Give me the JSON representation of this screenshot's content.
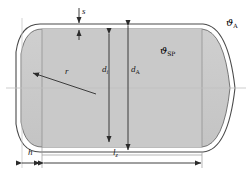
{
  "figure": {
    "type": "engineering-cross-section",
    "fill_color": "#c9c9c9",
    "outline_color": "#3a3a3a",
    "dimension_color": "#2b2b2b",
    "centerline_color": "#b8b8b8",
    "background": "#ffffff"
  },
  "labels": {
    "wall_thickness": {
      "symbol": "s",
      "subscript": ""
    },
    "radius": {
      "symbol": "r",
      "subscript": ""
    },
    "inner_diameter": {
      "symbol": "d",
      "subscript": "i"
    },
    "outer_diameter": {
      "symbol": "d",
      "subscript": "A"
    },
    "cap_height": {
      "symbol": "h",
      "subscript": ""
    },
    "cyl_length": {
      "symbol": "l",
      "subscript": "z"
    },
    "temp_ambient": {
      "symbol": "ϑ",
      "subscript": "A"
    },
    "temp_storage": {
      "symbol": "ϑ",
      "subscript": "SP"
    }
  },
  "dimensions": [
    {
      "name": "s",
      "orientation": "vertical",
      "kind": "wall-thickness"
    },
    {
      "name": "r",
      "orientation": "diagonal",
      "kind": "radius-leader"
    },
    {
      "name": "d_i",
      "orientation": "vertical",
      "kind": "double-arrow"
    },
    {
      "name": "d_A",
      "orientation": "vertical",
      "kind": "double-arrow"
    },
    {
      "name": "h",
      "orientation": "horizontal",
      "kind": "double-arrow"
    },
    {
      "name": "l_z",
      "orientation": "horizontal",
      "kind": "double-arrow"
    }
  ]
}
